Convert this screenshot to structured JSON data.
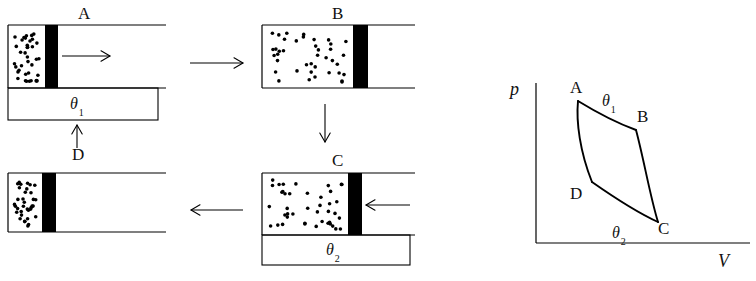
{
  "figure": {
    "title_text": "",
    "stroke_color": "#000000",
    "piston_color": "#000000",
    "background": "#ffffff"
  },
  "process_panels": [
    {
      "id": "panel-a",
      "label": "A",
      "label_x": 78,
      "label_y": 5,
      "cylinder": {
        "x": 8,
        "y": 25,
        "w": 158,
        "h": 63
      },
      "gas": {
        "x": 8,
        "y": 25,
        "w": 37,
        "h": 63
      },
      "piston": {
        "x": 45,
        "y": 25,
        "w": 13,
        "h": 63
      },
      "dot_count": 38,
      "reservoir": {
        "x": 8,
        "y": 88,
        "w": 150,
        "h": 32,
        "label": "θ",
        "subscript": "1"
      },
      "reservoir_label_x": 70,
      "reservoir_label_y": 96,
      "piston_arrow": {
        "x1": 62,
        "y1": 56,
        "x2": 110,
        "y2": 56,
        "direction": "right"
      }
    },
    {
      "id": "panel-b",
      "label": "B",
      "label_x": 332,
      "label_y": 5,
      "cylinder": {
        "x": 262,
        "y": 25,
        "w": 153,
        "h": 63
      },
      "gas": {
        "x": 262,
        "y": 25,
        "w": 91,
        "h": 63
      },
      "piston": {
        "x": 353,
        "y": 25,
        "w": 15,
        "h": 63
      },
      "dot_count": 40,
      "reservoir": null,
      "piston_arrow": null
    },
    {
      "id": "panel-c",
      "label": "C",
      "label_x": 332,
      "label_y": 152,
      "cylinder": {
        "x": 262,
        "y": 173,
        "w": 153,
        "h": 62
      },
      "gas": {
        "x": 262,
        "y": 173,
        "w": 86,
        "h": 62
      },
      "piston": {
        "x": 348,
        "y": 173,
        "w": 14,
        "h": 62
      },
      "dot_count": 42,
      "reservoir": {
        "x": 262,
        "y": 235,
        "w": 148,
        "h": 30,
        "label": "θ",
        "subscript": "2"
      },
      "reservoir_label_x": 326,
      "reservoir_label_y": 242,
      "piston_arrow": {
        "x1": 410,
        "y1": 205,
        "x2": 366,
        "y2": 205,
        "direction": "left"
      }
    },
    {
      "id": "panel-d",
      "label": "D",
      "label_x": 72,
      "label_y": 146,
      "cylinder": {
        "x": 8,
        "y": 173,
        "w": 158,
        "h": 59
      },
      "gas": {
        "x": 8,
        "y": 173,
        "w": 34,
        "h": 59
      },
      "piston": {
        "x": 42,
        "y": 173,
        "w": 14,
        "h": 59
      },
      "dot_count": 36,
      "reservoir": null,
      "piston_arrow": null
    }
  ],
  "cycle_arrows": [
    {
      "name": "arrow-a-to-b",
      "x1": 190,
      "y1": 63,
      "x2": 243,
      "y2": 63,
      "direction": "right"
    },
    {
      "name": "arrow-b-to-c",
      "x1": 325,
      "y1": 104,
      "x2": 325,
      "y2": 142,
      "direction": "down"
    },
    {
      "name": "arrow-c-to-d",
      "x1": 243,
      "y1": 210,
      "x2": 191,
      "y2": 210,
      "direction": "left"
    },
    {
      "name": "arrow-d-to-a",
      "x1": 77,
      "y1": 148,
      "x2": 77,
      "y2": 125,
      "direction": "up"
    }
  ],
  "chart_data": {
    "type": "line",
    "title": "",
    "xlabel": "V",
    "ylabel": "p",
    "grid": false,
    "legend": "none",
    "axis_origin_px": {
      "x": 536,
      "y": 243
    },
    "axis_top_px": 83,
    "axis_right_px": 750,
    "labels": {
      "p_axis": {
        "text": "p",
        "x": 510,
        "y": 80
      },
      "V_axis": {
        "text": "V",
        "x": 718,
        "y": 252
      }
    },
    "points": [
      {
        "name": "A",
        "px": 578,
        "py": 101,
        "label_x": 570,
        "label_y": 79
      },
      {
        "name": "B",
        "px": 636,
        "py": 130,
        "label_x": 637,
        "label_y": 108
      },
      {
        "name": "C",
        "px": 658,
        "py": 222,
        "label_x": 658,
        "label_y": 220
      },
      {
        "name": "D",
        "px": 592,
        "py": 182,
        "label_x": 570,
        "label_y": 185
      }
    ],
    "curves": [
      {
        "name": "isotherm-AB",
        "from": "A",
        "to": "B",
        "kind": "isothermal-expansion",
        "annotation": {
          "text": "θ",
          "subscript": "1",
          "x": 602,
          "y": 93
        },
        "path": "M 578 101 C 596 112, 614 122, 636 130"
      },
      {
        "name": "adiabat-BC",
        "from": "B",
        "to": "C",
        "kind": "adiabatic-expansion",
        "annotation": null,
        "path": "M 636 130 C 644 160, 650 196, 658 222"
      },
      {
        "name": "isotherm-CD",
        "from": "C",
        "to": "D",
        "kind": "isothermal-compression",
        "annotation": {
          "text": "θ",
          "subscript": "2",
          "x": 612,
          "y": 225
        },
        "path": "M 658 222 C 636 212, 612 196, 592 182"
      },
      {
        "name": "adiabat-DA",
        "from": "D",
        "to": "A",
        "kind": "adiabatic-compression",
        "annotation": null,
        "path": "M 592 182 C 580 152, 576 122, 578 101"
      }
    ]
  }
}
